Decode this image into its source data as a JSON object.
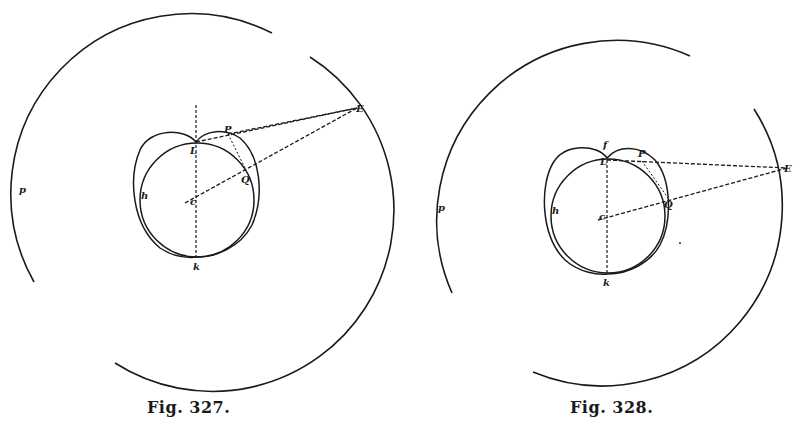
{
  "figures": [
    {
      "caption": "Fig. 327.",
      "labels": {
        "E": "E",
        "P": "P",
        "L": "L",
        "Q": "Q",
        "k": "k",
        "h": "h",
        "c": "c",
        "p": "p"
      }
    },
    {
      "caption": "Fig. 328.",
      "labels": {
        "E": "E",
        "P": "P",
        "L": "L",
        "f": "f",
        "Q": "Q",
        "k": "k",
        "h": "h",
        "c": "c",
        "p": "p"
      }
    }
  ],
  "colors": {
    "ink": "#1a1a1a",
    "paper": "#ffffff"
  }
}
